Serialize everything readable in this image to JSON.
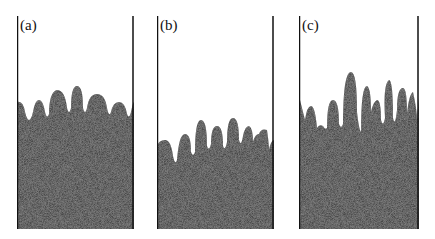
{
  "figure": {
    "panels": [
      {
        "label": "(a)"
      },
      {
        "label": "(b)"
      },
      {
        "label": "(c)"
      }
    ],
    "colors": {
      "granular": "#4a4a4a",
      "wall": "#111111",
      "background": "#ffffff"
    }
  }
}
